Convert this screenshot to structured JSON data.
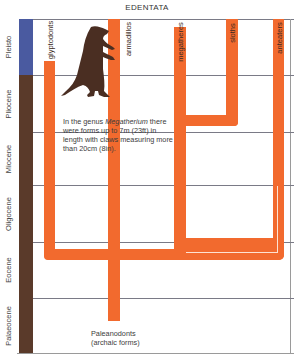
{
  "title": "EDENTATA",
  "colors": {
    "branch": "#f26a2e",
    "pleistocene_band": "#4a5aa0",
    "epoch_band": "#5a3a2a",
    "silhouette": "#4a2e22",
    "grid_line": "#7a7a86"
  },
  "epochs": [
    {
      "label": "Pleisto",
      "color": "#4a5aa0"
    },
    {
      "label": "Pliocene",
      "color": "#5a3a2a"
    },
    {
      "label": "Miocene",
      "color": "#5a3a2a"
    },
    {
      "label": "Oligocene",
      "color": "#5a3a2a"
    },
    {
      "label": "Eocene",
      "color": "#5a3a2a"
    },
    {
      "label": "Palaeocene",
      "color": "#5a3a2a"
    }
  ],
  "taxa": [
    {
      "label": "glyptodonts"
    },
    {
      "label": "armadillos"
    },
    {
      "label": "megatheres"
    },
    {
      "label": "sloths"
    },
    {
      "label": "anteaters"
    }
  ],
  "note": {
    "prefix": "In the genus ",
    "genus": "Megatherium",
    "suffix": " there were forms up to 7m (23ft) in length with claws measuring more than 20cm (8in)."
  },
  "footnote": {
    "line1": "Paleanodonts",
    "line2": "(archaic forms)"
  },
  "illustration": {
    "icon": "giant-ground-sloth-silhouette"
  }
}
